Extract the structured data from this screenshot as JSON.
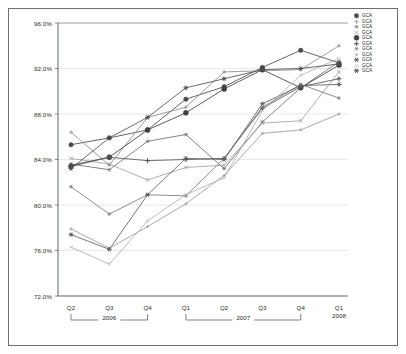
{
  "chart_data": {
    "type": "line",
    "title": "",
    "subtitle": "",
    "xlabel": "",
    "ylabel": "",
    "ylim": [
      72.0,
      96.0
    ],
    "ytick_labels": [
      "96.0%",
      "92.0%",
      "88.0%",
      "84.0%",
      "80.0%",
      "76.0%",
      "72.0%"
    ],
    "ytick_values": [
      96.0,
      92.0,
      88.0,
      84.0,
      80.0,
      76.0,
      72.0
    ],
    "grid": true,
    "grid_axis": "y",
    "legend_position": "top-right",
    "categories": [
      "Q2",
      "Q3",
      "Q4",
      "Q1",
      "Q2",
      "Q3",
      "Q4",
      "Q1"
    ],
    "x_group_labels": [
      "2006",
      "2007",
      "2008"
    ],
    "x_groups": [
      {
        "label": "2006",
        "start_index": 0,
        "end_index": 2
      },
      {
        "label": "2007",
        "start_index": 3,
        "end_index": 6
      },
      {
        "label": "2008",
        "start_index": 7,
        "end_index": 7
      }
    ],
    "series": [
      {
        "name": "GCA",
        "marker": "filled-circle",
        "color": "#4a4a4a",
        "values": [
          85.3,
          85.9,
          86.6,
          89.3,
          90.4,
          92.1,
          93.6,
          92.5
        ]
      },
      {
        "name": "GCA",
        "marker": "plus",
        "color": "#8d8d8d",
        "values": [
          86.4,
          83.5,
          87.7,
          88.6,
          91.7,
          91.8,
          91.9,
          94.0
        ]
      },
      {
        "name": "GCA",
        "marker": "star",
        "color": "#6e6e6e",
        "values": [
          83.6,
          83.1,
          85.6,
          86.2,
          83.2,
          87.3,
          90.3,
          92.6
        ]
      },
      {
        "name": "GCA",
        "marker": "cross-thin",
        "color": "#a0a0a0",
        "values": [
          84.1,
          83.6,
          82.2,
          83.3,
          83.5,
          87.2,
          87.4,
          91.7
        ]
      },
      {
        "name": "GCA",
        "marker": "filled-circle-lg",
        "color": "#3f3f3f",
        "values": [
          83.4,
          84.2,
          86.6,
          88.1,
          90.2,
          91.9,
          90.3,
          92.3
        ]
      },
      {
        "name": "GCA",
        "marker": "plus-bold",
        "color": "#555555",
        "values": [
          83.5,
          84.2,
          83.9,
          84.0,
          84.1,
          88.5,
          90.4,
          91.1
        ]
      },
      {
        "name": "GCA",
        "marker": "asterisk",
        "color": "#787878",
        "values": [
          81.6,
          79.2,
          80.9,
          80.8,
          84.1,
          88.6,
          90.6,
          89.4
        ]
      },
      {
        "name": "GCA",
        "marker": "plus-small",
        "color": "#9a9a9a",
        "values": [
          77.9,
          76.2,
          78.1,
          80.1,
          82.6,
          86.3,
          86.6,
          88.0
        ]
      },
      {
        "name": "GCA",
        "marker": "star-bold",
        "color": "#606060",
        "values": [
          77.4,
          76.1,
          80.9,
          84.1,
          84.0,
          88.9,
          90.5,
          90.6
        ]
      },
      {
        "name": "GCA",
        "marker": "cross-light",
        "color": "#b0b0b0",
        "values": [
          76.3,
          74.8,
          78.6,
          80.9,
          82.4,
          88.3,
          91.4,
          92.9
        ]
      },
      {
        "name": "GCA",
        "marker": "asterisk-bold",
        "color": "#4f4f4f",
        "values": [
          83.2,
          85.9,
          87.7,
          90.3,
          91.1,
          91.9,
          92.0,
          92.4
        ]
      }
    ]
  },
  "legend": {
    "entries": [
      {
        "label": "GCA"
      },
      {
        "label": "GCA"
      },
      {
        "label": "GCA"
      },
      {
        "label": "GCA"
      },
      {
        "label": "GCA"
      },
      {
        "label": "GCA"
      },
      {
        "label": "GCA"
      },
      {
        "label": "GCA"
      },
      {
        "label": "GCA"
      },
      {
        "label": "GCA"
      },
      {
        "label": "GCA"
      }
    ]
  }
}
